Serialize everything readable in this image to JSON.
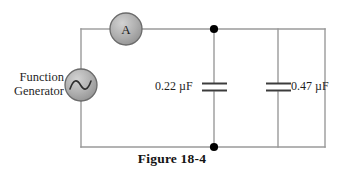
{
  "figure": {
    "caption": "Figure 18-4",
    "source_label": "Function\nGenerator",
    "source_line1": "Function",
    "source_line2": "Generator",
    "ammeter_label": "A",
    "capacitor1_label": "0.22 µF",
    "capacitor2_label": "0.47 µF"
  },
  "circuit": {
    "type": "ac-parallel-capacitor-circuit",
    "background_color": "#ffffff",
    "wire_color": "#9a9a9a",
    "node_color": "#000000",
    "component_fill": "#a8a8a8",
    "component_stroke": "#555555",
    "text_color": "#1f1f1f",
    "components": [
      {
        "name": "function-generator",
        "kind": "ac-source",
        "label": "Function Generator",
        "cx": 81,
        "cy": 85,
        "r": 16
      },
      {
        "name": "ammeter",
        "kind": "meter",
        "label": "A",
        "cx": 126,
        "cy": 29,
        "r": 16
      },
      {
        "name": "capacitor-1",
        "kind": "capacitor",
        "label": "0.22 µF",
        "value": "0.22",
        "unit": "µF",
        "x": 214,
        "y": 87
      },
      {
        "name": "capacitor-2",
        "kind": "capacitor",
        "label": "0.47 µF",
        "value": "0.47",
        "unit": "µF",
        "x": 278,
        "y": 87
      }
    ],
    "nodes": [
      {
        "name": "top-junction",
        "x": 214,
        "y": 29
      },
      {
        "name": "bottom-junction",
        "x": 214,
        "y": 147
      }
    ],
    "loop": {
      "left": 81,
      "right": 325,
      "top": 29,
      "bottom": 147
    }
  }
}
